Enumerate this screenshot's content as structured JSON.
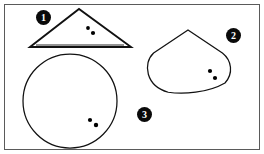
{
  "figure": {
    "width": 264,
    "height": 154,
    "background_color": "#ffffff",
    "frame": {
      "color": "#5a5a5a",
      "stroke_width": 1,
      "x": 4,
      "y": 4,
      "width": 256,
      "height": 146
    },
    "ink_color": "#111111",
    "dot_color": "#000000",
    "shapes": [
      {
        "id": "shape-1",
        "label": "1",
        "kind": "triangle",
        "stroke_width": 1.9,
        "apex": {
          "x": 79,
          "y": 9
        },
        "base_left": {
          "x": 30,
          "y": 47
        },
        "base_right": {
          "x": 131,
          "y": 47
        },
        "inner_base_left": {
          "x": 36,
          "y": 45
        },
        "inner_base_right": {
          "x": 124,
          "y": 45
        },
        "marker": {
          "x": 36,
          "y": 10
        },
        "dots": [
          {
            "x": 88,
            "y": 28,
            "r": 1.9
          },
          {
            "x": 93,
            "y": 33,
            "r": 2.1
          }
        ]
      },
      {
        "id": "shape-2",
        "label": "2",
        "kind": "teardrop",
        "stroke_width": 1.25,
        "apex": {
          "x": 188,
          "y": 30
        },
        "body_center": {
          "x": 188,
          "y": 68
        },
        "body_rx": 43,
        "body_ry": 25,
        "marker": {
          "x": 226,
          "y": 28
        },
        "dots": [
          {
            "x": 210,
            "y": 71,
            "r": 2.1
          },
          {
            "x": 215,
            "y": 78,
            "r": 2.1
          }
        ]
      },
      {
        "id": "shape-3",
        "label": "3",
        "kind": "circle",
        "stroke_width": 1.25,
        "center": {
          "x": 70,
          "y": 101
        },
        "radius": 47,
        "marker": {
          "x": 137,
          "y": 107
        },
        "dots": [
          {
            "x": 90,
            "y": 120,
            "r": 2.1
          },
          {
            "x": 96,
            "y": 125,
            "r": 2.2
          }
        ]
      }
    ]
  },
  "chart_data": {
    "type": "diagram",
    "title": "",
    "items": [
      {
        "marker": "1",
        "shape": "triangle",
        "dot_count": 2
      },
      {
        "marker": "2",
        "shape": "teardrop",
        "dot_count": 2
      },
      {
        "marker": "3",
        "shape": "circle",
        "dot_count": 2
      }
    ]
  }
}
